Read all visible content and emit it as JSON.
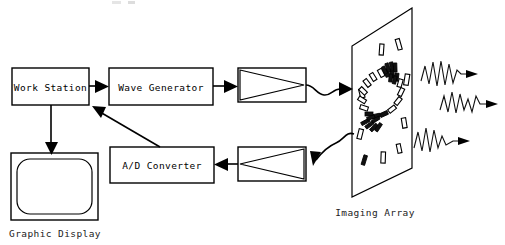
{
  "diagram": {
    "title_artifact": "",
    "blocks": [
      {
        "id": "work-station",
        "label": "Work Station"
      },
      {
        "id": "wave-generator",
        "label": "Wave Generator"
      },
      {
        "id": "ad-converter",
        "label": "A/D Converter"
      }
    ],
    "captions": [
      {
        "id": "graphic-display",
        "label": "Graphic Display"
      },
      {
        "id": "imaging-array",
        "label": "Imaging Array"
      }
    ],
    "symbols": [
      {
        "id": "transmit-amplifier",
        "name": "amplifier-triangle-right"
      },
      {
        "id": "receive-amplifier",
        "name": "amplifier-triangle-left"
      },
      {
        "id": "imaging-array-plane",
        "name": "parallelogram-transducer-plane"
      },
      {
        "id": "crt-monitor",
        "name": "monitor-screen"
      }
    ],
    "signals": [
      {
        "id": "wave-trace-1",
        "name": "output-waveform-top"
      },
      {
        "id": "wave-trace-2",
        "name": "output-waveform-middle"
      },
      {
        "id": "wave-trace-3",
        "name": "output-waveform-bottom"
      }
    ],
    "flow": [
      {
        "from": "work-station",
        "to": "wave-generator"
      },
      {
        "from": "wave-generator",
        "to": "transmit-amplifier"
      },
      {
        "from": "transmit-amplifier",
        "to": "imaging-array"
      },
      {
        "from": "imaging-array",
        "to": "receive-amplifier"
      },
      {
        "from": "receive-amplifier",
        "to": "ad-converter"
      },
      {
        "from": "ad-converter",
        "to": "work-station"
      },
      {
        "from": "work-station",
        "to": "graphic-display"
      }
    ],
    "colors": {
      "ink": "#000000",
      "paper": "#ffffff",
      "caption": "#222222"
    }
  }
}
